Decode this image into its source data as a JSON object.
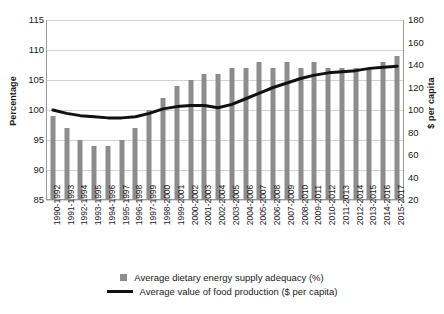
{
  "chart_data": {
    "type": "bar",
    "title": "",
    "xlabel": "",
    "ylabel": "Percentage",
    "y2label": "$ per capita",
    "ylim": [
      85,
      115
    ],
    "y2lim": [
      20,
      180
    ],
    "yticks": [
      85,
      90,
      95,
      100,
      105,
      110,
      115
    ],
    "y2ticks": [
      20,
      40,
      60,
      80,
      100,
      120,
      140,
      160,
      180
    ],
    "grid": true,
    "legend_position": "bottom",
    "categories": [
      "1990-1992",
      "1991-1993",
      "1992-1994",
      "1993-1995",
      "1994-1996",
      "1995-1997",
      "1996-1998",
      "1997-1999",
      "1998-2000",
      "1999-2001",
      "2000-2002",
      "2001-2003",
      "2002-2004",
      "2003-2005",
      "2004-2006",
      "2005-2007",
      "2006-2008",
      "2007-2009",
      "2008-2010",
      "2009-2011",
      "2010-2012",
      "2011-2013",
      "2012-2014",
      "2013-2015",
      "2014-2016",
      "2015-2017"
    ],
    "series": [
      {
        "name": "Average dietary energy supply adequacy (%)",
        "type": "bar",
        "axis": "left",
        "color": "#8c8c8c",
        "values": [
          99,
          97,
          95,
          94,
          94,
          95,
          97,
          100,
          102,
          104,
          105,
          106,
          106,
          107,
          107,
          108,
          107,
          108,
          107,
          108,
          107,
          107,
          107,
          107,
          108,
          109
        ]
      },
      {
        "name": "Average value of food production ($ per capita)",
        "type": "line",
        "axis": "right",
        "color": "#111111",
        "values": [
          100,
          97,
          95,
          94,
          93,
          93,
          94,
          97,
          101,
          103,
          104,
          104,
          102,
          105,
          110,
          115,
          120,
          124,
          128,
          131,
          133,
          134,
          135,
          137,
          138,
          139
        ]
      }
    ]
  },
  "legend": {
    "bar_label": "Average dietary energy supply adequacy (%)",
    "line_label": "Average value of food production ($ per capita)"
  }
}
